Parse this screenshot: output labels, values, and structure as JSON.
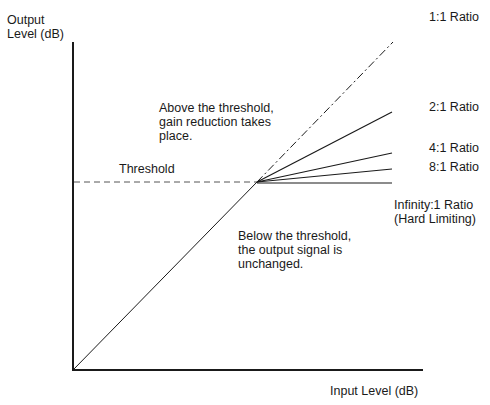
{
  "diagram": {
    "y_axis_label": "Output\nLevel (dB)",
    "x_axis_label": "Input Level (dB)",
    "threshold_label": "Threshold",
    "annotation_above": "Above the threshold,\ngain reduction takes\nplace.",
    "annotation_below": "Below the threshold,\nthe output signal is\nunchanged.",
    "ratios": [
      {
        "label": "1:1 Ratio",
        "style": "dash-dot"
      },
      {
        "label": "2:1 Ratio",
        "style": "solid"
      },
      {
        "label": "4:1 Ratio",
        "style": "solid"
      },
      {
        "label": "8:1 Ratio",
        "style": "solid"
      },
      {
        "label": "Infinity:1 Ratio\n(Hard Limiting)",
        "style": "solid"
      }
    ],
    "colors": {
      "line": "#1a1a1a",
      "background": "#ffffff"
    }
  }
}
